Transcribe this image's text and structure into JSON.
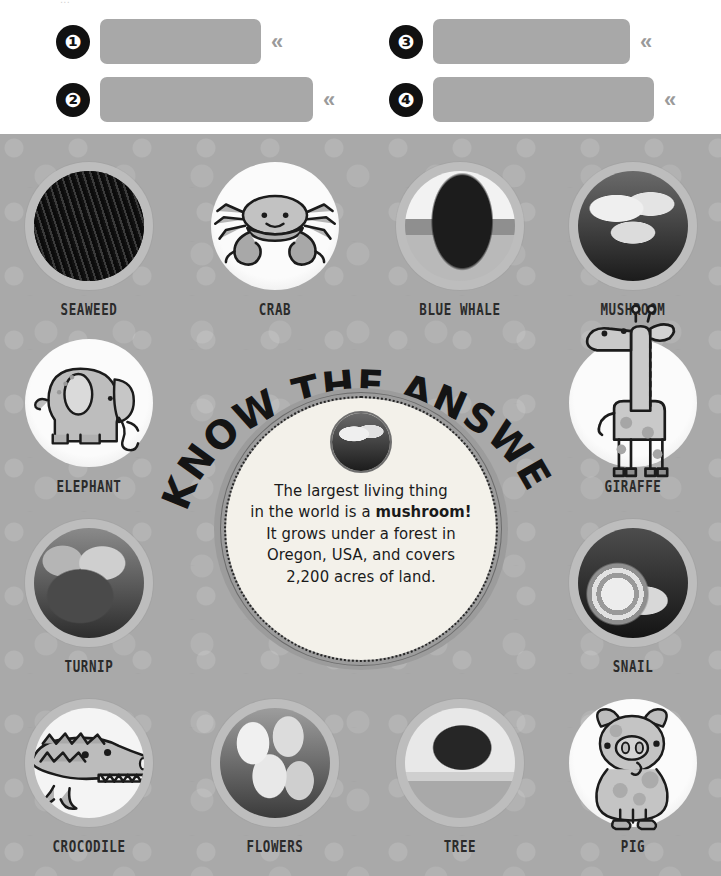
{
  "top_partial_text": "...",
  "answers": {
    "chevron": "«",
    "items": [
      {
        "number": "❶",
        "value": "",
        "placeholder": ""
      },
      {
        "number": "❷",
        "value": "",
        "placeholder": ""
      },
      {
        "number": "❸",
        "value": "",
        "placeholder": ""
      },
      {
        "number": "❹",
        "value": "",
        "placeholder": ""
      }
    ]
  },
  "board": {
    "background_color": "#a9a9a9",
    "tiles": [
      {
        "label": "SEAWEED",
        "kind": "photo",
        "art": "seaweed-photo"
      },
      {
        "label": "CRAB",
        "kind": "cartoon",
        "art": "crab-illustration"
      },
      {
        "label": "BLUE WHALE",
        "kind": "photo",
        "art": "blue-whale-photo"
      },
      {
        "label": "MUSHROOM",
        "kind": "photo",
        "art": "mushroom-photo"
      },
      {
        "label": "ELEPHANT",
        "kind": "cartoon",
        "art": "elephant-illustration"
      },
      {
        "label": "GIRAFFE",
        "kind": "cartoon",
        "art": "giraffe-illustration"
      },
      {
        "label": "TURNIP",
        "kind": "photo",
        "art": "turnip-photo"
      },
      {
        "label": "SNAIL",
        "kind": "photo",
        "art": "snail-photo"
      },
      {
        "label": "CROCODILE",
        "kind": "cartoon",
        "art": "crocodile-illustration"
      },
      {
        "label": "FLOWERS",
        "kind": "photo",
        "art": "flowers-photo"
      },
      {
        "label": "TREE",
        "kind": "photo",
        "art": "tree-photo"
      },
      {
        "label": "PIG",
        "kind": "cartoon",
        "art": "pig-illustration"
      }
    ]
  },
  "badge": {
    "arc_title": "I KNOW THE ANSWER!",
    "thumbnail": "mushroom-photo",
    "line1": "The largest living thing",
    "line2a": "in the world is a ",
    "line2b": "mushroom!",
    "line3": "It grows under a forest in",
    "line4": "Oregon, USA, and covers",
    "line5": "2,200 acres of land."
  }
}
